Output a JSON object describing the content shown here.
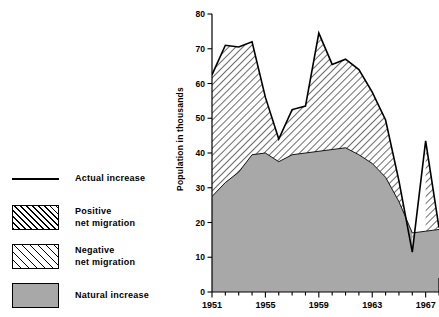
{
  "legend": {
    "items": [
      {
        "name": "actual-increase",
        "label": "Actual increase",
        "style": "line"
      },
      {
        "name": "positive-net-migration",
        "label": "Positive\nnet migration",
        "style": "hatch-dense"
      },
      {
        "name": "negative-net-migration",
        "label": "Negative\nnet migration",
        "style": "hatch-sparse"
      },
      {
        "name": "natural-increase",
        "label": "Natural increase",
        "style": "solid-gray"
      }
    ]
  },
  "axes": {
    "ylabel": "Population in thousands",
    "yticks": [
      "0",
      "10",
      "20",
      "30",
      "40",
      "50",
      "60",
      "70",
      "80"
    ],
    "xticks_labeled": [
      "1951",
      "1955",
      "1959",
      "1963",
      "1967"
    ]
  },
  "colors": {
    "natural_increase_fill": "#a8a8a8",
    "line": "#000000",
    "background": "#ffffff"
  },
  "chart_data": {
    "type": "area",
    "title": "",
    "xlabel": "",
    "ylabel": "Population in thousands",
    "xlim": [
      1951,
      1968
    ],
    "ylim": [
      0,
      80
    ],
    "grid": false,
    "legend_position": "left",
    "x": [
      1951,
      1952,
      1953,
      1954,
      1955,
      1956,
      1957,
      1958,
      1959,
      1960,
      1961,
      1962,
      1963,
      1964,
      1965,
      1966,
      1967,
      1968
    ],
    "series": [
      {
        "name": "Actual increase",
        "type": "line",
        "values": [
          62.5,
          71.0,
          70.5,
          72.0,
          56.0,
          44.0,
          52.5,
          53.5,
          74.5,
          65.5,
          67.0,
          64.0,
          57.5,
          49.5,
          32.0,
          11.5,
          43.5,
          18.5
        ]
      },
      {
        "name": "Natural increase",
        "type": "area",
        "values": [
          27.5,
          31.5,
          34.5,
          39.5,
          40.0,
          37.5,
          39.5,
          40.0,
          40.5,
          41.0,
          41.5,
          39.5,
          37.0,
          33.0,
          26.0,
          17.0,
          17.5,
          18.0
        ]
      }
    ],
    "derived_series": [
      {
        "name": "Positive net migration",
        "description": "Area between actual increase and natural increase where actual exceeds natural",
        "values": [
          35.0,
          39.5,
          36.0,
          32.5,
          16.0,
          6.5,
          13.0,
          13.5,
          34.0,
          24.5,
          25.5,
          24.5,
          20.5,
          16.5,
          6.0,
          0.0,
          26.0,
          0.5
        ]
      },
      {
        "name": "Negative net migration",
        "description": "Area where actual increase falls below natural increase",
        "values": [
          0,
          0,
          0,
          0,
          0,
          0,
          0,
          0,
          0,
          0,
          0,
          0,
          0,
          0,
          0,
          -5.5,
          0,
          0
        ]
      }
    ]
  }
}
